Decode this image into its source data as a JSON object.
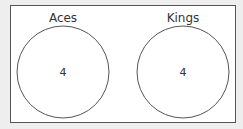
{
  "diagram": {
    "type": "venn",
    "sets": [
      {
        "label": "Aces",
        "value": "4"
      },
      {
        "label": "Kings",
        "value": "4"
      }
    ]
  },
  "colors": {
    "stroke": "#555555",
    "background": "#ffffff",
    "page": "#eeeeee"
  }
}
